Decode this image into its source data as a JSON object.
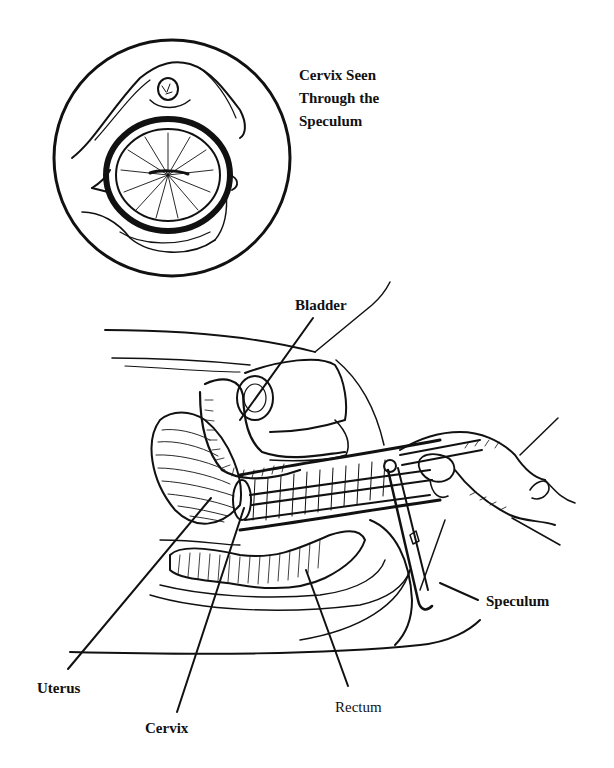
{
  "figure": {
    "inset": {
      "title_lines": [
        "Cervix Seen",
        "Through the",
        "Speculum"
      ]
    },
    "labels": {
      "bladder": "Bladder",
      "speculum": "Speculum",
      "uterus": "Uterus",
      "cervix": "Cervix",
      "rectum": "Rectum"
    },
    "colors": {
      "ink": "#111111",
      "background": "#ffffff"
    }
  }
}
